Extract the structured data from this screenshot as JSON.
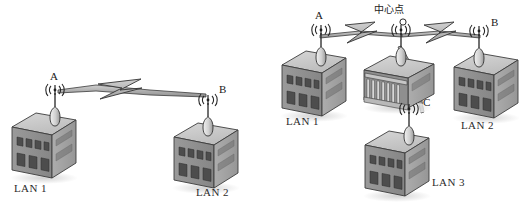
{
  "figure": {
    "title": "",
    "background_color": "#ffffff",
    "ink_color": "#3a3a3a",
    "panels": [
      {
        "id": "panel-left",
        "name": "point-to-point-wireless-bridge",
        "topology": "point-to-point",
        "nodes": [
          {
            "id": "A",
            "label": "A",
            "icon": "antenna-icon",
            "building_label": "LAN 1"
          },
          {
            "id": "B",
            "label": "B",
            "icon": "antenna-icon",
            "building_label": "LAN 2"
          }
        ],
        "links": [
          {
            "from": "A",
            "to": "B",
            "icon": "lightning-bolt-icon",
            "style": "wireless"
          }
        ],
        "building_labels": [
          "LAN 1",
          "LAN 2"
        ]
      },
      {
        "id": "panel-right",
        "name": "star-wireless-bridge-with-center-point",
        "topology": "star",
        "center": {
          "id": "O",
          "label": "O",
          "caption": "中心点",
          "icon": "antenna-icon",
          "building_icon": "colonnade-building-icon"
        },
        "nodes": [
          {
            "id": "A",
            "label": "A",
            "icon": "antenna-icon",
            "building_label": "LAN 1"
          },
          {
            "id": "B",
            "label": "B",
            "icon": "antenna-icon",
            "building_label": "LAN 2"
          },
          {
            "id": "C",
            "label": "C",
            "icon": "antenna-icon",
            "building_label": "LAN 3"
          }
        ],
        "links": [
          {
            "from": "A",
            "to": "O",
            "icon": "lightning-bolt-icon",
            "style": "wireless"
          },
          {
            "from": "O",
            "to": "B",
            "icon": "lightning-bolt-icon",
            "style": "wireless"
          },
          {
            "from": "O",
            "to": "C",
            "icon": "lightning-bolt-icon",
            "style": "wireless"
          }
        ],
        "building_labels": [
          "LAN 1",
          "LAN 2",
          "LAN 3"
        ]
      }
    ],
    "colors": {
      "building_front": "#8d8d8d",
      "building_side": "#a3a3a3",
      "building_roof": "#c9c9c9",
      "window": "#4a4a4a",
      "outline": "#33333 3",
      "bolt_fill": "#b5b5b5",
      "shadow": "#d8d8d8",
      "text": "#222222"
    }
  },
  "labels": {
    "left": {
      "node_a": "A",
      "node_b": "B",
      "lan1": "LAN 1",
      "lan2": "LAN 2"
    },
    "right": {
      "node_a": "A",
      "node_b": "B",
      "node_c": "C",
      "center_caption": "中心点",
      "center_point": "O",
      "lan1": "LAN 1",
      "lan2": "LAN 2",
      "lan3": "LAN 3"
    }
  }
}
